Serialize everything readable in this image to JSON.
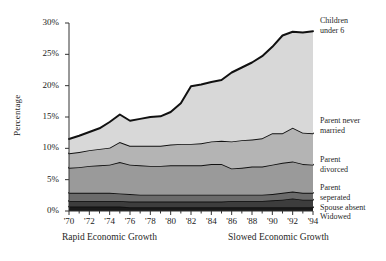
{
  "chart_data": {
    "type": "area",
    "title": "",
    "subtitle": "",
    "xlabel": "",
    "ylabel": "Percentage",
    "stacked": true,
    "grid": false,
    "legend_position": "right",
    "xlim": [
      1970,
      1994
    ],
    "ylim": [
      0,
      30
    ],
    "yunit": "%",
    "x": [
      1970,
      1971,
      1972,
      1973,
      1974,
      1975,
      1976,
      1977,
      1978,
      1979,
      1980,
      1981,
      1982,
      1983,
      1984,
      1985,
      1986,
      1987,
      1988,
      1989,
      1990,
      1991,
      1992,
      1993,
      1994
    ],
    "xtick_labels": [
      "'70",
      "'72",
      "'74",
      "'76",
      "'78",
      "'80",
      "'82",
      "'84",
      "'86",
      "'88",
      "'90",
      "'92",
      "'94"
    ],
    "xtick_values": [
      1970,
      1972,
      1974,
      1976,
      1978,
      1980,
      1982,
      1984,
      1986,
      1988,
      1990,
      1992,
      1994
    ],
    "ytick_labels": [
      "0%",
      "5%",
      "10%",
      "15%",
      "20%",
      "25%",
      "30%"
    ],
    "ytick_values": [
      0,
      5,
      10,
      15,
      20,
      25,
      30
    ],
    "series": [
      {
        "name": "Widowed",
        "color": "#1a1a1a",
        "values": [
          0.7,
          0.7,
          0.7,
          0.7,
          0.7,
          0.7,
          0.6,
          0.6,
          0.6,
          0.6,
          0.6,
          0.6,
          0.6,
          0.6,
          0.6,
          0.6,
          0.6,
          0.6,
          0.6,
          0.6,
          0.6,
          0.6,
          0.6,
          0.6,
          0.6
        ]
      },
      {
        "name": "Spouse absent",
        "color": "#3d3d3d",
        "values": [
          0.9,
          0.9,
          0.9,
          0.9,
          0.9,
          0.9,
          0.9,
          0.9,
          0.9,
          0.9,
          0.9,
          0.9,
          0.9,
          0.9,
          0.9,
          0.9,
          1.0,
          1.0,
          1.0,
          1.0,
          1.1,
          1.2,
          1.4,
          1.2,
          1.2
        ]
      },
      {
        "name": "Parent seperated",
        "color": "#6b6b6b",
        "values": [
          1.3,
          1.3,
          1.3,
          1.3,
          1.3,
          1.2,
          1.2,
          1.1,
          1.1,
          1.1,
          1.1,
          1.1,
          1.1,
          1.1,
          1.1,
          1.1,
          1.0,
          1.0,
          1.0,
          1.0,
          1.0,
          1.1,
          1.1,
          1.1,
          1.1
        ]
      },
      {
        "name": "Parent divorced",
        "color": "#9a9a9a",
        "values": [
          4.0,
          4.1,
          4.3,
          4.4,
          4.5,
          5.0,
          4.7,
          4.7,
          4.6,
          4.6,
          4.7,
          4.7,
          4.7,
          4.7,
          4.9,
          4.9,
          4.2,
          4.3,
          4.5,
          4.5,
          4.7,
          4.8,
          4.8,
          4.6,
          4.5
        ]
      },
      {
        "name": "Parent never married",
        "color": "#b4b4b4",
        "values": [
          2.3,
          2.4,
          2.5,
          2.6,
          2.7,
          3.2,
          3.0,
          3.1,
          3.2,
          3.2,
          3.3,
          3.4,
          3.4,
          3.5,
          3.6,
          3.7,
          4.3,
          4.4,
          4.3,
          4.5,
          5.0,
          4.7,
          5.4,
          5.0,
          5.0
        ]
      },
      {
        "name": "Children under 6",
        "color": "#d8d8d8",
        "values": [
          2.3,
          2.6,
          2.9,
          3.3,
          4.1,
          4.4,
          4.0,
          4.3,
          4.6,
          4.7,
          5.2,
          6.5,
          9.2,
          9.4,
          9.5,
          9.7,
          11.0,
          11.6,
          12.3,
          13.1,
          13.8,
          15.6,
          15.3,
          16.0,
          16.3
        ]
      }
    ],
    "totals": [
      11.5,
      12.0,
      12.6,
      13.2,
      14.2,
      15.4,
      14.4,
      14.7,
      15.0,
      15.1,
      15.8,
      17.2,
      19.9,
      20.2,
      20.6,
      20.9,
      22.1,
      22.9,
      23.7,
      24.7,
      26.2,
      28.0,
      28.6,
      28.5,
      28.7
    ]
  },
  "axes": {
    "ylabel": "Percentage"
  },
  "annotations": {
    "left_period": "Rapid Economic Growth",
    "right_period": "Slowed Economic Growth"
  },
  "legend": {
    "children_under_6": "Children\nunder 6",
    "children_under_6_line1": "Children",
    "children_under_6_line2": "under 6",
    "parent_never_married_line1": "Parent never",
    "parent_never_married_line2": "married",
    "parent_divorced_line1": "Parent",
    "parent_divorced_line2": "divorced",
    "parent_seperated_line1": "Parent",
    "parent_seperated_line2": "seperated",
    "spouse_absent": "Spouse absent",
    "widowed": "Widowed"
  }
}
